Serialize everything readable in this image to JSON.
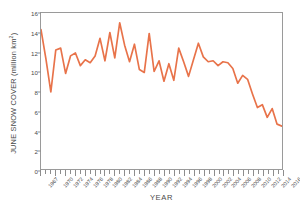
{
  "chart_data": {
    "type": "line",
    "title": "",
    "xlabel": "YEAR",
    "ylabel": "JUNE SNOW COVER (million km",
    "ylabel_sup": "2",
    "ylabel_suffix": ")",
    "series_name": "June snow cover",
    "line_color": "#e8734a",
    "xlim": [
      1967,
      2016
    ],
    "ylim": [
      0,
      16
    ],
    "yticks": [
      0,
      2,
      4,
      6,
      8,
      10,
      12,
      14,
      16
    ],
    "ytick_labels": [
      "0",
      "2",
      "4",
      "6",
      "8",
      "10",
      "12",
      "14",
      "16"
    ],
    "xtick_labels": [
      "1967",
      "1970",
      "1972",
      "1974",
      "1976",
      "1978",
      "1980",
      "1982",
      "1984",
      "1986",
      "1988",
      "1990",
      "1992",
      "1994",
      "1996",
      "1998",
      "2000",
      "2002",
      "2004",
      "2006",
      "2008",
      "2010",
      "2012",
      "2014",
      "2016"
    ],
    "xtick_values": [
      1967,
      1970,
      1972,
      1974,
      1976,
      1978,
      1980,
      1982,
      1984,
      1986,
      1988,
      1990,
      1992,
      1994,
      1996,
      1998,
      2000,
      2002,
      2004,
      2006,
      2008,
      2010,
      2012,
      2014,
      2016
    ],
    "grid": false,
    "legend": "none",
    "x": [
      1967,
      1968,
      1969,
      1970,
      1971,
      1972,
      1973,
      1974,
      1975,
      1976,
      1977,
      1978,
      1979,
      1980,
      1981,
      1982,
      1983,
      1984,
      1985,
      1986,
      1987,
      1988,
      1989,
      1990,
      1991,
      1992,
      1993,
      1994,
      1995,
      1996,
      1997,
      1998,
      1999,
      2000,
      2001,
      2002,
      2003,
      2004,
      2005,
      2006,
      2007,
      2008,
      2009,
      2010,
      2011,
      2012,
      2013,
      2014,
      2015,
      2016
    ],
    "values": [
      14.3,
      11.3,
      7.9,
      12.2,
      12.4,
      9.8,
      11.6,
      11.9,
      10.6,
      11.2,
      10.9,
      11.6,
      13.4,
      11.1,
      14.0,
      11.4,
      15.0,
      12.7,
      11.0,
      12.8,
      10.2,
      9.9,
      13.9,
      10.0,
      11.1,
      9.0,
      10.8,
      9.1,
      12.4,
      11.0,
      9.5,
      11.2,
      12.9,
      11.5,
      11.0,
      11.1,
      10.6,
      11.0,
      10.9,
      10.3,
      8.8,
      9.6,
      9.2,
      7.7,
      6.3,
      6.6,
      5.3,
      6.2,
      4.6,
      4.4
    ]
  }
}
